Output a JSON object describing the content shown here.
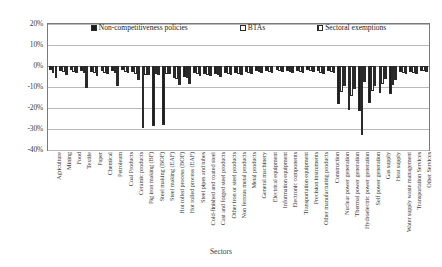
{
  "chart_data": {
    "type": "bar",
    "title": "",
    "xlabel": "Sectors",
    "ylabel": "",
    "ylim": [
      -40,
      20
    ],
    "ytick_labels": [
      "20%",
      "10%",
      "0%",
      "-10%",
      "-20%",
      "-30%",
      "-40%"
    ],
    "ytick_values": [
      20,
      10,
      0,
      -10,
      -20,
      -30,
      -40
    ],
    "grid": true,
    "legend_position": "top-inside",
    "categories": [
      "Agriculture",
      "Mining",
      "Food",
      "Textile",
      "Paper",
      "Chemical",
      "Petroleum",
      "Coal Products",
      "Ceramic products",
      "Pig iron making (BF)",
      "Steel making (BOF)",
      "Steel making (EAF)",
      "Hot rolled process (BOF)",
      "Hot rolled process (EAF)",
      "Steel pipes and tubes",
      "Cold-finished and coated steel",
      "Cast and forged steel products",
      "Other iron or steel products",
      "Non ferrous metal products",
      "Metal products",
      "General machinery",
      "Electrical equipment",
      "Information equipment",
      "Electronic components",
      "Transportation equipment",
      "Precision instruments",
      "Other manufacturing products",
      "Construction",
      "Nuclear power generation",
      "Thermal power generation",
      "Hydroelectric power generation",
      "Self power generation",
      "Gas supply",
      "Heat supply",
      "Water supply waste management",
      "Transportation Services",
      "Other Services"
    ],
    "series": [
      {
        "name": "Non-competitiveness policies",
        "color": "#1d1d1d",
        "values": [
          -2.0,
          -2.6,
          -1.9,
          -2.4,
          -2.9,
          -2.4,
          -2.4,
          -2.1,
          -3.0,
          -29.5,
          -28.5,
          -28.0,
          -5.5,
          -5.0,
          -3.4,
          -3.6,
          -3.8,
          -3.1,
          -3.2,
          -2.8,
          -2.4,
          -2.3,
          -2.0,
          -2.2,
          -2.3,
          -2.0,
          -2.6,
          -2.4,
          -18.0,
          -21.0,
          -21.5,
          -17.5,
          -13.0,
          -13.5,
          -3.0,
          -3.0,
          -2.2
        ]
      },
      {
        "name": "BTAs",
        "color": "#ffffff",
        "values": [
          -3.2,
          -3.0,
          -2.8,
          -3.2,
          -3.5,
          -3.1,
          -3.2,
          -2.9,
          -3.6,
          -4.2,
          -3.9,
          -3.7,
          -6.0,
          -5.6,
          -4.0,
          -4.2,
          -4.4,
          -3.8,
          -3.8,
          -3.4,
          -3.0,
          -2.9,
          -2.6,
          -2.8,
          -2.9,
          -2.6,
          -3.1,
          -2.9,
          -12.5,
          -14.5,
          -33.0,
          -12.0,
          -8.5,
          -9.0,
          -3.5,
          -3.4,
          -2.6
        ]
      },
      {
        "name": "Sectoral exemptions",
        "color": "#ffffff",
        "values": [
          -5.5,
          -4.1,
          -3.2,
          -10.5,
          -4.8,
          -3.6,
          -9.5,
          -3.4,
          -6.5,
          -4.5,
          -4.2,
          -4.0,
          -9.0,
          -8.5,
          -4.6,
          -4.8,
          -5.0,
          -4.3,
          -4.2,
          -3.9,
          -3.4,
          -3.3,
          -3.0,
          -3.2,
          -3.3,
          -3.0,
          -3.6,
          -3.3,
          -9.5,
          -11.0,
          -7.5,
          -9.5,
          -6.0,
          -6.5,
          -4.0,
          -3.9,
          -3.0
        ]
      }
    ]
  },
  "legend": {
    "entries": [
      {
        "label": "Non-competitiveness policies",
        "style": "solid-black"
      },
      {
        "label": "BTAs",
        "style": "hollow-white"
      },
      {
        "label": "Sectoral exemptions",
        "style": "vertical-hatch"
      }
    ]
  },
  "axis": {
    "x_title": "Sectors"
  }
}
